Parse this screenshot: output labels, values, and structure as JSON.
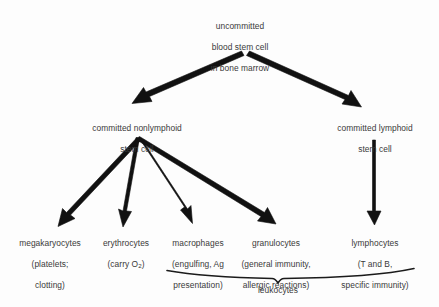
{
  "diagram": {
    "colors": {
      "background": "#fdfdfd",
      "text": "#3a3a3a",
      "arrow": "#111111"
    },
    "nodes": {
      "root": {
        "name": "uncommitted-blood-stem-cell",
        "lines": [
          "uncommitted",
          "blood stem cell",
          "in bone marrow"
        ]
      },
      "nonlymphoid": {
        "name": "committed-nonlymphoid-stem-cell",
        "lines": [
          "committed nonlymphoid",
          "stem cell"
        ]
      },
      "lymphoid": {
        "name": "committed-lymphoid-stem-cell",
        "lines": [
          "committed lymphoid",
          "stem cell"
        ]
      },
      "megakaryocytes": {
        "name": "megakaryocytes",
        "lines": [
          "megakaryocytes",
          "(platelets;",
          "clotting)"
        ]
      },
      "erythrocytes": {
        "name": "erythrocytes",
        "line1": "erythrocytes",
        "line2_pre": "(carry O",
        "line2_sub": "2",
        "line2_post": ")"
      },
      "macrophages": {
        "name": "macrophages",
        "lines": [
          "macrophages",
          "(engulfing, Ag",
          "presentation)"
        ]
      },
      "granulocytes": {
        "name": "granulocytes",
        "lines": [
          "granulocytes",
          "(general immunity,",
          "allergic reactions)"
        ]
      },
      "lymphocytes": {
        "name": "lymphocytes",
        "lines": [
          "lymphocytes",
          "(T and B,",
          "specific immunity)"
        ]
      }
    },
    "brace": {
      "label": "leukocytes",
      "groups": [
        "macrophages",
        "granulocytes",
        "lymphocytes"
      ]
    },
    "arrows": [
      {
        "name": "arrow-root-to-nonlymphoid",
        "from": "root",
        "to": "nonlymphoid"
      },
      {
        "name": "arrow-root-to-lymphoid",
        "from": "root",
        "to": "lymphoid"
      },
      {
        "name": "arrow-nonlymphoid-to-megakaryocytes",
        "from": "nonlymphoid",
        "to": "megakaryocytes"
      },
      {
        "name": "arrow-nonlymphoid-to-erythrocytes",
        "from": "nonlymphoid",
        "to": "erythrocytes"
      },
      {
        "name": "arrow-nonlymphoid-to-macrophages",
        "from": "nonlymphoid",
        "to": "macrophages"
      },
      {
        "name": "arrow-nonlymphoid-to-granulocytes",
        "from": "nonlymphoid",
        "to": "granulocytes"
      },
      {
        "name": "arrow-lymphoid-to-lymphocytes",
        "from": "lymphoid",
        "to": "lymphocytes"
      }
    ]
  }
}
